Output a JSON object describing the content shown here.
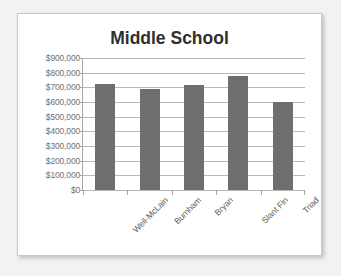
{
  "card": {
    "background_color": "#ffffff",
    "border_color": "#c9c9c9"
  },
  "chart_data": {
    "type": "bar",
    "title": "Middle School",
    "xlabel": "",
    "ylabel": "",
    "categories": [
      "Weil-McLain",
      "Burnham",
      "Bryan",
      "Slant Fin",
      "Triad"
    ],
    "values": [
      725000,
      690000,
      715000,
      780000,
      600000
    ],
    "series": [
      {
        "name": "Middle School",
        "values": [
          725000,
          690000,
          715000,
          780000,
          600000
        ],
        "color": "#6e6e6e"
      }
    ],
    "ylim": [
      0,
      900000
    ],
    "ytick_values": [
      0,
      100000,
      200000,
      300000,
      400000,
      500000,
      600000,
      700000,
      800000,
      900000
    ],
    "ytick_labels": [
      "$900,000",
      "$800,000",
      "$700,000",
      "$600,000",
      "$500,000",
      "$400,000",
      "$300,000",
      "$200,000",
      "$100,000",
      "$0"
    ],
    "grid": true,
    "gridline_color": "#b8b8b8",
    "axis_color": "#a5a5a5",
    "legend": false,
    "legend_position": "none",
    "title_color": "#2f2f2f",
    "tick_label_color": "#6f6f6f",
    "category_label_color": "#5d5d5d",
    "category_label_rotation": -45
  }
}
